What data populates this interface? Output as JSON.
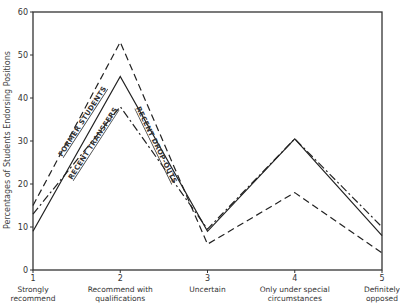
{
  "chart_data": {
    "type": "line",
    "title": "",
    "xlabel": "",
    "ylabel": "Percentages of Students Endorsing Positions",
    "ylim": [
      0,
      60
    ],
    "yticks": [
      0,
      10,
      20,
      30,
      40,
      50,
      60
    ],
    "grid": false,
    "legend": "inline labels along lines",
    "x": [
      1,
      2,
      3,
      4,
      5
    ],
    "categories": [
      "Strongly recommend",
      "Recommend with qualifications",
      "Uncertain",
      "Only under special circumstances",
      "Definitely opposed"
    ],
    "category_lines": [
      [
        "Strongly",
        "recommend"
      ],
      [
        "Recommend with",
        "qualifications"
      ],
      [
        "Uncertain"
      ],
      [
        "Only under special",
        "circumstances"
      ],
      [
        "Definitely",
        "opposed"
      ]
    ],
    "series": [
      {
        "name": "FORMER STUDENTS",
        "style": "dashed",
        "values": [
          15,
          53,
          6,
          18,
          4
        ]
      },
      {
        "name": "RECENT TRANSFERS",
        "style": "solid",
        "values": [
          9,
          45,
          9,
          30.5,
          8
        ]
      },
      {
        "name": "RECENT DROP-OUTS",
        "style": "dash-dot",
        "values": [
          13,
          38,
          9.5,
          30.5,
          10
        ]
      }
    ]
  }
}
